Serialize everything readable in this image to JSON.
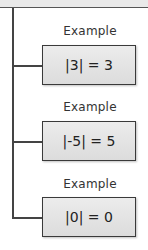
{
  "diagram": {
    "examples": [
      {
        "label": "Example",
        "expression": "|3| = 3"
      },
      {
        "label": "Example",
        "expression": "|-5| = 5"
      },
      {
        "label": "Example",
        "expression": "|0| = 0"
      }
    ]
  }
}
